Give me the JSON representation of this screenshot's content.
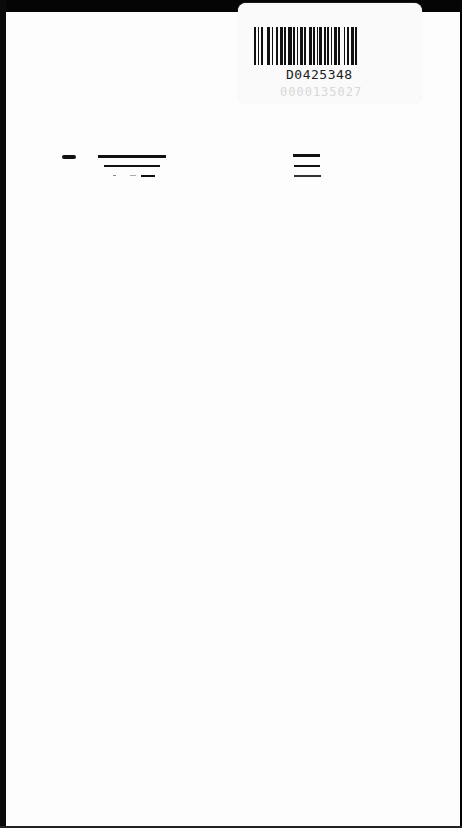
{
  "document": {
    "type": "scanned-page",
    "barcode_label": {
      "id_text": "D0425348",
      "faint_text": "0000135027"
    },
    "marks": {
      "left_group": [
        "short-dash",
        "long-rule",
        "medium-rule",
        "dotted-short-rule"
      ],
      "right_group": [
        "rule-1",
        "rule-2",
        "rule-3"
      ]
    }
  }
}
